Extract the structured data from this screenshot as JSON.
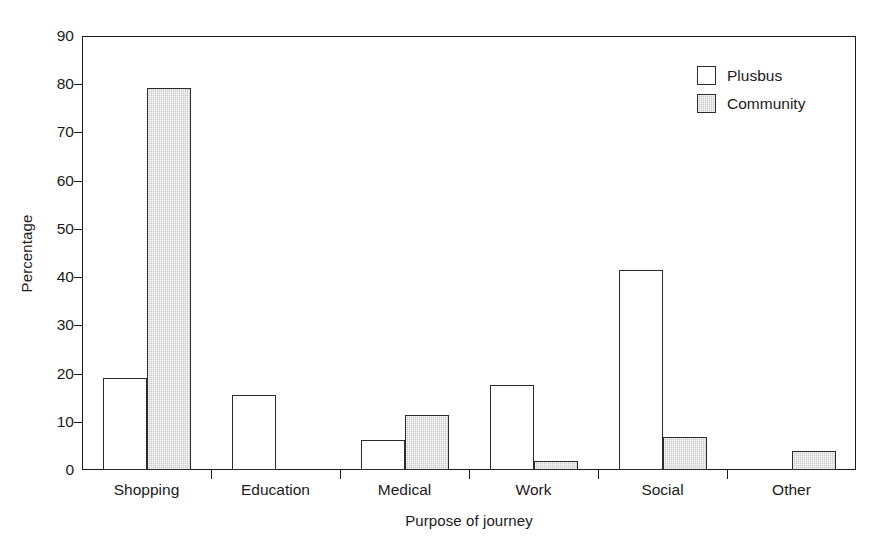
{
  "chart_data": {
    "type": "bar",
    "title": "",
    "subtitle": "",
    "xlabel": "Purpose of journey",
    "ylabel": "Percentage",
    "categories": [
      "Shopping",
      "Education",
      "Medical",
      "Work",
      "Social",
      "Other"
    ],
    "series": [
      {
        "name": "Plusbus",
        "values": [
          19.1,
          15.5,
          6.3,
          17.7,
          41.4,
          0.0
        ]
      },
      {
        "name": "Community",
        "values": [
          79.3,
          0.0,
          11.5,
          1.8,
          6.8,
          4.0
        ]
      }
    ],
    "ylim": [
      0,
      90
    ],
    "ytick_step": 10,
    "yticks": [
      "90",
      "80",
      "70",
      "60",
      "50",
      "40",
      "30",
      "20",
      "10",
      "0"
    ],
    "ytick_values": [
      90,
      80,
      70,
      60,
      50,
      40,
      30,
      20,
      10,
      0
    ],
    "grid": false,
    "legend_position": "top-right-inside",
    "legend": [
      {
        "label": "Plusbus",
        "swatch": "white-outlined-square"
      },
      {
        "label": "Community",
        "swatch": "gray-hatched-square"
      }
    ],
    "colors": {
      "plusbus_fill": "#ffffff",
      "community_fill": "#c9c9c9",
      "bar_outline": "#2b2b2b",
      "axis": "#1a1a1a",
      "background": "#ffffff"
    }
  }
}
